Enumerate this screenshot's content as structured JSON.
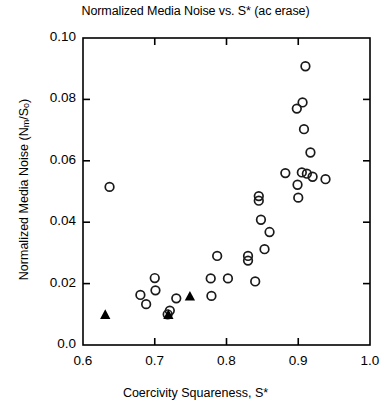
{
  "chart_data": {
    "type": "scatter",
    "title": "Normalized Media Noise vs. S* (ac erase)",
    "xlabel": "Coercivity Squareness, S*",
    "ylabel": "Normalized Media Noise (Nm/So)",
    "ylabel_parts": {
      "prefix": "Normalized Media Noise (N",
      "sub1": "m",
      "mid": "/S",
      "sub2": "o",
      "suffix": ")"
    },
    "xlim": [
      0.6,
      1.0
    ],
    "ylim": [
      0.0,
      0.1
    ],
    "xticks": [
      0.6,
      0.7,
      0.8,
      0.9,
      1.0
    ],
    "xtick_labels": [
      "0.6",
      "0.7",
      "0.8",
      "0.9",
      "1.0"
    ],
    "yticks": [
      0.0,
      0.02,
      0.04,
      0.06,
      0.08,
      0.1
    ],
    "ytick_labels": [
      "0.0",
      "0.02",
      "0.04",
      "0.06",
      "0.08",
      "0.10"
    ],
    "grid": false,
    "legend": "none",
    "series": [
      {
        "name": "open-circles",
        "marker": "open-circle",
        "color": "#1a1a1a",
        "points": [
          [
            0.637,
            0.0515
          ],
          [
            0.68,
            0.0163
          ],
          [
            0.688,
            0.0133
          ],
          [
            0.7,
            0.0218
          ],
          [
            0.701,
            0.0178
          ],
          [
            0.718,
            0.01
          ],
          [
            0.721,
            0.0112
          ],
          [
            0.73,
            0.0152
          ],
          [
            0.778,
            0.0217
          ],
          [
            0.779,
            0.016
          ],
          [
            0.787,
            0.029
          ],
          [
            0.802,
            0.0217
          ],
          [
            0.83,
            0.0275
          ],
          [
            0.83,
            0.029
          ],
          [
            0.84,
            0.0207
          ],
          [
            0.845,
            0.047
          ],
          [
            0.845,
            0.0485
          ],
          [
            0.848,
            0.0408
          ],
          [
            0.853,
            0.0312
          ],
          [
            0.86,
            0.0368
          ],
          [
            0.882,
            0.056
          ],
          [
            0.898,
            0.077
          ],
          [
            0.899,
            0.0522
          ],
          [
            0.9,
            0.048
          ],
          [
            0.905,
            0.0562
          ],
          [
            0.906,
            0.079
          ],
          [
            0.908,
            0.0703
          ],
          [
            0.91,
            0.0908
          ],
          [
            0.912,
            0.0558
          ],
          [
            0.917,
            0.0627
          ],
          [
            0.92,
            0.0548
          ],
          [
            0.938,
            0.054
          ]
        ]
      },
      {
        "name": "filled-triangles",
        "marker": "filled-triangle",
        "color": "#000000",
        "points": [
          [
            0.631,
            0.0098
          ],
          [
            0.719,
            0.0098
          ],
          [
            0.749,
            0.0158
          ]
        ]
      }
    ]
  },
  "axes": {
    "frame_color": "#000000",
    "background": "#ffffff"
  }
}
